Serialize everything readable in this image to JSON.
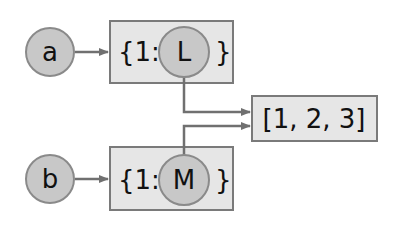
{
  "diagram": {
    "variables": [
      {
        "name": "a",
        "id": "var-a"
      },
      {
        "name": "b",
        "id": "var-b"
      }
    ],
    "dicts": [
      {
        "open": "{1:",
        "key_obj": "L",
        "close": "}"
      },
      {
        "open": "{1:",
        "key_obj": "M",
        "close": "}"
      }
    ],
    "shared_list": {
      "label": "[1, 2, 3]"
    },
    "colors": {
      "circle_fill": "#c8c8c8",
      "circle_stroke": "#8a8a8a",
      "box_fill": "#e6e6e6",
      "box_stroke": "#7a7a7a",
      "arrow": "#707070",
      "text": "#111111"
    }
  }
}
